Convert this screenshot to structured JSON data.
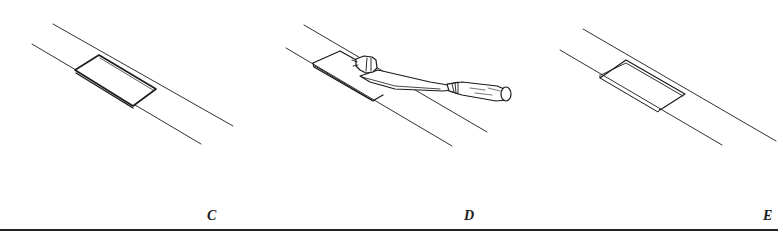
{
  "figure": {
    "panels": [
      {
        "label": "C",
        "description": "Marked-out rectangular recess between two parallel guide lines"
      },
      {
        "label": "D",
        "description": "Chisel with mallet-struck handle paring out the recess"
      },
      {
        "label": "E",
        "description": "Finished recess cut into the surface"
      }
    ]
  },
  "colors": {
    "ink": "#1a1a1a",
    "background": "#ffffff"
  }
}
